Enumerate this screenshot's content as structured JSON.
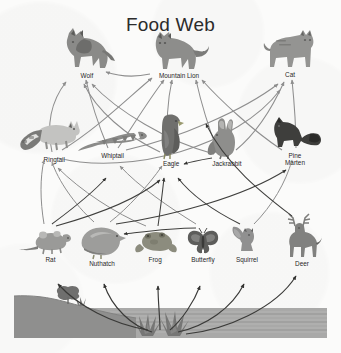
{
  "title": "Food Web",
  "diagram": {
    "type": "food-web",
    "kind": "ecological food web diagram",
    "arrow_meaning": "arrow points from food source to the consumer that eats it",
    "arrow_colors": {
      "upper": "#8e8e8e",
      "lower": "#3a3a3a"
    },
    "tiers": [
      {
        "name": "tertiary-consumers",
        "label_row": "top",
        "members": [
          "Wolf",
          "Mountain Lion",
          "Cat"
        ]
      },
      {
        "name": "secondary-consumers",
        "label_row": "second",
        "members": [
          "Ringtail",
          "Whiptail",
          "Eagle",
          "Jackrabbit",
          "Pine Marten"
        ]
      },
      {
        "name": "primary-consumers",
        "label_row": "third",
        "members": [
          "Rat",
          "Nuthatch",
          "Frog",
          "Butterfly",
          "Squirrel",
          "Deer"
        ]
      },
      {
        "name": "producers",
        "label_row": "base",
        "members": [
          "Plants"
        ]
      }
    ],
    "organisms": [
      {
        "id": "wolf",
        "label": "Wolf",
        "icon": "wolf-icon",
        "tier": 1,
        "x": 87,
        "y": 30
      },
      {
        "id": "mountain-lion",
        "label": "Mountain Lion",
        "icon": "mountain-lion-icon",
        "tier": 1,
        "x": 178,
        "y": 33
      },
      {
        "id": "cat",
        "label": "Cat",
        "icon": "cat-icon",
        "tier": 1,
        "x": 289,
        "y": 32
      },
      {
        "id": "ringtail",
        "label": "Ringtail",
        "icon": "ringtail-icon",
        "tier": 2,
        "x": 48,
        "y": 124
      },
      {
        "id": "whiptail",
        "label": "Whiptail",
        "icon": "whiptail-lizard-icon",
        "tier": 2,
        "x": 113,
        "y": 128
      },
      {
        "id": "eagle",
        "label": "Eagle",
        "icon": "eagle-icon",
        "tier": 2,
        "x": 172,
        "y": 120
      },
      {
        "id": "jackrabbit",
        "label": "Jackrabbit",
        "icon": "jackrabbit-icon",
        "tier": 2,
        "x": 224,
        "y": 126
      },
      {
        "id": "pine-marten",
        "label": "Pine Marten",
        "icon": "pine-marten-icon",
        "tier": 2,
        "x": 294,
        "y": 122
      },
      {
        "id": "rat",
        "label": "Rat",
        "icon": "rat-icon",
        "tier": 3,
        "x": 48,
        "y": 232
      },
      {
        "id": "nuthatch",
        "label": "Nuthatch",
        "icon": "nuthatch-bird-icon",
        "tier": 3,
        "x": 102,
        "y": 230
      },
      {
        "id": "frog",
        "label": "Frog",
        "icon": "frog-icon",
        "tier": 3,
        "x": 155,
        "y": 234
      },
      {
        "id": "butterfly",
        "label": "Butterfly",
        "icon": "butterfly-icon",
        "tier": 3,
        "x": 203,
        "y": 234
      },
      {
        "id": "squirrel",
        "label": "Squirrel",
        "icon": "squirrel-icon",
        "tier": 3,
        "x": 245,
        "y": 232
      },
      {
        "id": "deer",
        "label": "Deer",
        "icon": "deer-icon",
        "tier": 3,
        "x": 299,
        "y": 224
      }
    ],
    "base_scene": {
      "name": "habitat-base",
      "features": [
        "hillside",
        "shrub",
        "grass-tuft",
        "water-stripes"
      ],
      "colors": {
        "ground": "#9a9a99",
        "hill": "#8d8d8c",
        "water": "#a9a9a8",
        "plant": "#7d7d7c"
      }
    },
    "edges": [
      {
        "from": "Plants",
        "to": "Rat"
      },
      {
        "from": "Plants",
        "to": "Nuthatch"
      },
      {
        "from": "Plants",
        "to": "Frog"
      },
      {
        "from": "Plants",
        "to": "Butterfly"
      },
      {
        "from": "Plants",
        "to": "Squirrel"
      },
      {
        "from": "Plants",
        "to": "Deer"
      },
      {
        "from": "Rat",
        "to": "Ringtail"
      },
      {
        "from": "Rat",
        "to": "Eagle"
      },
      {
        "from": "Rat",
        "to": "Whiptail"
      },
      {
        "from": "Nuthatch",
        "to": "Ringtail"
      },
      {
        "from": "Nuthatch",
        "to": "Eagle"
      },
      {
        "from": "Nuthatch",
        "to": "Pine Marten"
      },
      {
        "from": "Frog",
        "to": "Eagle"
      },
      {
        "from": "Frog",
        "to": "Ringtail"
      },
      {
        "from": "Butterfly",
        "to": "Whiptail"
      },
      {
        "from": "Butterfly",
        "to": "Nuthatch"
      },
      {
        "from": "Squirrel",
        "to": "Eagle"
      },
      {
        "from": "Squirrel",
        "to": "Pine Marten"
      },
      {
        "from": "Deer",
        "to": "Mountain Lion"
      },
      {
        "from": "Deer",
        "to": "Wolf"
      },
      {
        "from": "Jackrabbit",
        "to": "Eagle"
      },
      {
        "from": "Jackrabbit",
        "to": "Mountain Lion"
      },
      {
        "from": "Jackrabbit",
        "to": "Cat"
      },
      {
        "from": "Ringtail",
        "to": "Wolf"
      },
      {
        "from": "Ringtail",
        "to": "Mountain Lion"
      },
      {
        "from": "Whiptail",
        "to": "Eagle"
      },
      {
        "from": "Whiptail",
        "to": "Cat"
      },
      {
        "from": "Eagle",
        "to": "Mountain Lion"
      },
      {
        "from": "Pine Marten",
        "to": "Cat"
      },
      {
        "from": "Pine Marten",
        "to": "Mountain Lion"
      },
      {
        "from": "Mountain Lion",
        "to": "Wolf"
      }
    ]
  }
}
